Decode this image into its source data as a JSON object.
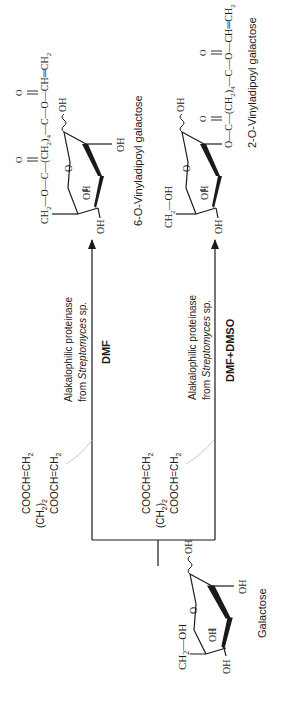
{
  "diagram": {
    "type": "reaction-scheme",
    "orientation": "rotated-90-ccw",
    "starting_material": {
      "name": "Galactose",
      "ring_labels": {
        "ch2oh_group": "CH2—OH",
        "ch2": "CH",
        "ch2_sub": "2",
        "oh_top": "OH",
        "oh_c3": "OH",
        "oh_c4": "OH",
        "oh_anomeric": "OH",
        "oh_c2": "OH",
        "ring_o": "O"
      }
    },
    "reagent": {
      "line1": "COOCH=CH",
      "line1_sub": "2",
      "line2_prefix": "(CH",
      "line2_sub": "2",
      "line2_suffix": ")",
      "line2_sub2": "2",
      "line3": "COOCH=CH",
      "line3_sub": "2"
    },
    "reactions": [
      {
        "enzyme_line1": "Alakalophilic proteinase",
        "enzyme_line2_prefix": "from ",
        "enzyme_line2_italic": "Streptomyces",
        "enzyme_line2_suffix": " sp.",
        "solvent": "DMF",
        "product": {
          "name": "6-O-Vinyladipoyl galactose",
          "chain": {
            "ch2": "CH",
            "ch2_sub": "2",
            "o1": "O",
            "c1": "C",
            "carbonyl1": "O",
            "ch2_4": "(CH",
            "ch2_4_sub": "2",
            "ch2_4_close": ")",
            "ch2_4_n": "4",
            "c2": "C",
            "carbonyl2": "O",
            "o2": "O",
            "vinyl": "CH═CH",
            "vinyl_sub": "2"
          },
          "ring_labels": {
            "oh_c4": "OH",
            "oh_c3": "OH",
            "oh_c2": "OH",
            "oh_anomeric": "OH",
            "ring_o": "O"
          }
        }
      },
      {
        "enzyme_line1": "Alakalophilic proteinase",
        "enzyme_line2_prefix": "from ",
        "enzyme_line2_italic": "Streptomyces",
        "enzyme_line2_suffix": " sp.",
        "solvent": "DMF+DMSO",
        "product": {
          "name": "2-O-Vinyladipoyl galactose",
          "chain": {
            "o1": "O",
            "c1": "C",
            "carbonyl1": "O",
            "ch2_4": "(CH",
            "ch2_4_sub": "2",
            "ch2_4_close": ")",
            "ch2_4_n": "4",
            "c2": "C",
            "carbonyl2": "O",
            "o2": "O",
            "vinyl": "CH═CH",
            "vinyl_sub": "2"
          },
          "ring_labels": {
            "ch2oh_ch": "CH",
            "ch2oh_sub": "2",
            "ch2oh_oh": "OH",
            "oh_c4": "OH",
            "oh_c3": "OH",
            "oh_anomeric": "OH",
            "ring_o": "O"
          }
        }
      }
    ],
    "colors": {
      "ink": "#1a1a1a",
      "background": "#ffffff"
    }
  }
}
